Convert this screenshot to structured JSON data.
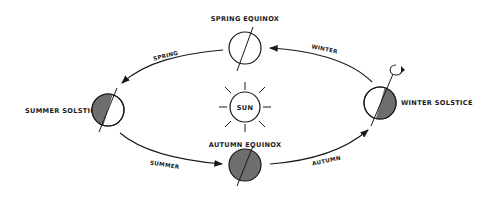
{
  "diagram": {
    "center": {
      "label": "SUN"
    },
    "positions": [
      {
        "id": "spring-equinox",
        "label": "SPRING EQUINOX",
        "shading": "none"
      },
      {
        "id": "summer-solstice",
        "label": "SUMMER SOLSTICE",
        "shading": "left-half"
      },
      {
        "id": "autumn-equinox",
        "label": "AUTUMN EQUINOX",
        "shading": "full"
      },
      {
        "id": "winter-solstice",
        "label": "WINTER SOLSTICE",
        "shading": "right-half"
      }
    ],
    "seasons": [
      {
        "label": "SPRING",
        "from": "spring-equinox",
        "to": "summer-solstice"
      },
      {
        "label": "SUMMER",
        "from": "summer-solstice",
        "to": "autumn-equinox"
      },
      {
        "label": "AUTUMN",
        "from": "autumn-equinox",
        "to": "winter-solstice"
      },
      {
        "label": "WINTER",
        "from": "winter-solstice",
        "to": "spring-equinox"
      }
    ],
    "rotation_indicator": "counterclockwise-arrow-icon",
    "colors": {
      "ink": "#1a1a1a",
      "shade": "#6e6e6e",
      "background": "#ffffff"
    }
  }
}
